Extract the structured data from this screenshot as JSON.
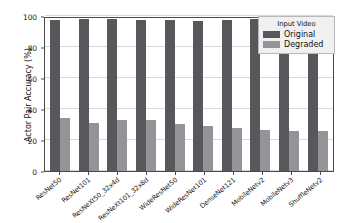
{
  "chart_data": {
    "type": "bar",
    "title": "",
    "xlabel": "",
    "ylabel": "Actor Pair Accuracy (%)",
    "ylim": [
      0,
      100
    ],
    "yticks": [
      0,
      20,
      40,
      60,
      80,
      100
    ],
    "grid": true,
    "legend": {
      "title": "Input Video",
      "position": "top-right",
      "entries": [
        "Original",
        "Degraded"
      ]
    },
    "categories": [
      "ResNet50",
      "ResNet101",
      "ResNeXt50_32x4d",
      "ResNeXt101_32x8d",
      "WideResNet50",
      "WideResNet101",
      "DenseNet121",
      "MobileNetv2",
      "MobileNetv3",
      "ShuffleNetv2"
    ],
    "series": [
      {
        "name": "Original",
        "color": "#58585c",
        "values": [
          97.6,
          97.8,
          97.9,
          97.6,
          97.2,
          96.9,
          97.5,
          97.9,
          97.8,
          97.6
        ]
      },
      {
        "name": "Degraded",
        "color": "#949498",
        "values": [
          34.0,
          30.8,
          32.6,
          32.8,
          30.6,
          28.9,
          27.8,
          26.5,
          25.6,
          25.7
        ]
      }
    ]
  },
  "axes": {
    "y_tick_labels": [
      "0",
      "20",
      "40",
      "60",
      "80",
      "100"
    ],
    "y_axis_title": "Actor Pair Accuracy (%)"
  },
  "legend": {
    "title": "Input Video",
    "items": [
      {
        "label": "Original",
        "color": "#58585c"
      },
      {
        "label": "Degraded",
        "color": "#949498"
      }
    ]
  }
}
